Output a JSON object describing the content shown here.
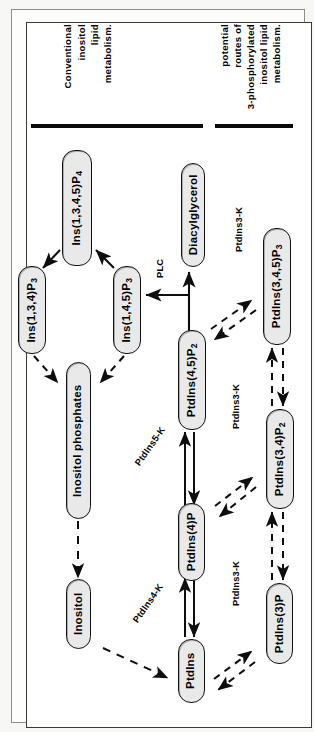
{
  "figure": {
    "orientation": "rotated-90-ccw",
    "headers": [
      {
        "id": "conventional",
        "text": "Conventional inositol lipid metabolism.",
        "lines": [
          "Conventional",
          "inositol",
          "lipid",
          "metabolism."
        ]
      },
      {
        "id": "three-phosphorylated",
        "text": "potential routes of 3-phosphorylated inositol lipid metabolism.",
        "lines": [
          "potential",
          "routes  of",
          "3-phosphorylated",
          "inositol   lipid",
          "metabolism."
        ]
      }
    ],
    "nodes": [
      {
        "id": "ins1345p4",
        "label": "Ins(1,3,4,5)P",
        "sub": "4"
      },
      {
        "id": "diacylglycerol",
        "label": "Diacylglycerol",
        "sub": ""
      },
      {
        "id": "ptdins345p3",
        "label": "PtdIns(3,4,5)P",
        "sub": "3"
      },
      {
        "id": "ins134p3",
        "label": "Ins(1,3,4)P",
        "sub": "3"
      },
      {
        "id": "ins145p3",
        "label": "Ins(1,4,5)P",
        "sub": "3"
      },
      {
        "id": "inositolphosphates",
        "label": "Inositol  phosphates",
        "sub": ""
      },
      {
        "id": "ptdins45p2",
        "label": "PtdIns(4,5)P",
        "sub": "2"
      },
      {
        "id": "ptdins34p2",
        "label": "PtdIns(3,4)P",
        "sub": "2"
      },
      {
        "id": "ptdins4p",
        "label": "PtdIns(4)P",
        "sub": ""
      },
      {
        "id": "ptdins3p",
        "label": "PtdIns(3)P",
        "sub": ""
      },
      {
        "id": "inositol",
        "label": "Inositol",
        "sub": ""
      },
      {
        "id": "ptdins",
        "label": "PtdIns",
        "sub": ""
      }
    ],
    "enzyme_labels": [
      {
        "id": "plc",
        "text": "PLC"
      },
      {
        "id": "ptdins3k-top",
        "text": "PtdIns3-K"
      },
      {
        "id": "ptdins3k-mid",
        "text": "PtdIns3-K"
      },
      {
        "id": "ptdins3k-bottom",
        "text": "PtdIns3-K"
      },
      {
        "id": "ptdins5k",
        "text": "PtdIns5-K"
      },
      {
        "id": "ptdins4k",
        "text": "PtdIns4-K"
      }
    ],
    "colors": {
      "node_fill": "#e9e9e9",
      "stroke": "#111111",
      "page": "#ffffff"
    }
  }
}
